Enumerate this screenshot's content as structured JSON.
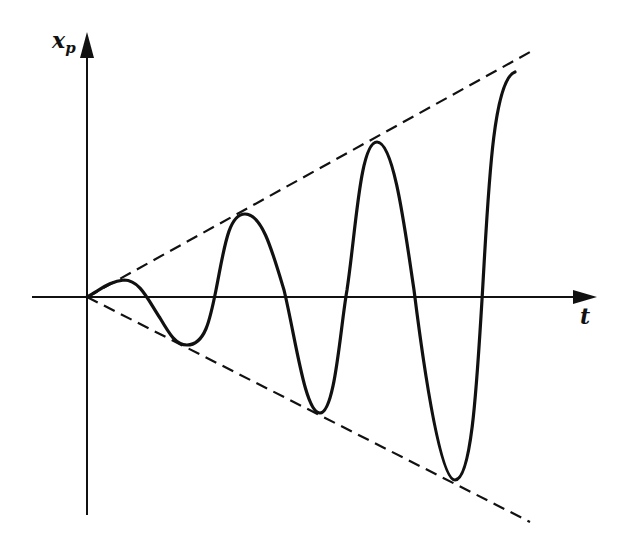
{
  "figure": {
    "colors": {
      "ink": "#111111",
      "background": "#ffffff"
    },
    "axes": {
      "y_label_main": "x",
      "y_label_sub": "p",
      "x_label": "t",
      "origin_px": [
        87,
        297
      ],
      "y_axis": {
        "from_px": [
          87,
          515
        ],
        "to_px": [
          87,
          32
        ],
        "arrow": true
      },
      "x_axis": {
        "from_px": [
          32,
          297
        ],
        "to_px": [
          596,
          297
        ],
        "arrow": true
      }
    },
    "envelope": {
      "style": "dashed",
      "upper": {
        "from_px": [
          87,
          297
        ],
        "to_px": [
          530,
          52
        ]
      },
      "lower": {
        "from_px": [
          87,
          297
        ],
        "to_px": [
          530,
          522
        ]
      }
    },
    "curve": {
      "style": "solid",
      "path": "M87,297 C100,290 110,281 124,280 C140,280 148,300 160,318 C170,335 176,345 187,345 C205,345 210,320 216,290 C224,250 228,214 245,214 C262,214 272,250 284,290 C296,340 305,413 320,413 C335,413 340,330 347,290 C356,230 360,142 377,142 C394,142 405,230 414,290 C424,370 440,480 455,480 C472,480 477,380 482,300 C488,200 492,80 515,72",
      "peaks_px": [
        [
          124,
          280
        ],
        [
          245,
          214
        ],
        [
          377,
          142
        ],
        [
          515,
          72
        ]
      ],
      "troughs_px": [
        [
          187,
          345
        ],
        [
          320,
          413
        ],
        [
          455,
          480
        ]
      ]
    }
  }
}
